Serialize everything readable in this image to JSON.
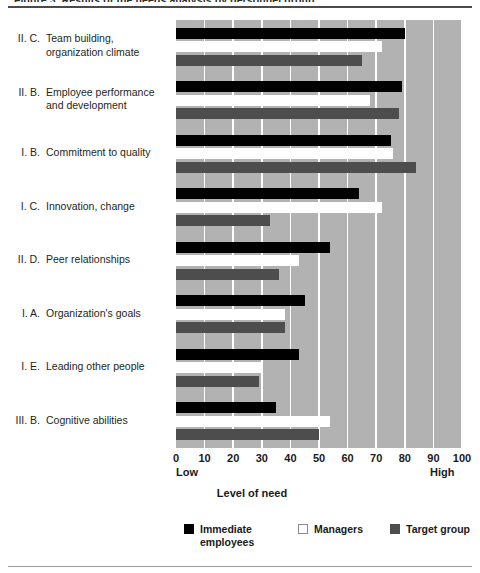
{
  "figure": {
    "caption_remnant": "Figure 3.  Results of the needs analysis by personnel group",
    "top_rule": "horizontal-rule",
    "bottom_rule": "horizontal-rule"
  },
  "chart_data": {
    "type": "bar",
    "orientation": "horizontal",
    "title": "",
    "xlabel": "Level of need",
    "ylabel": "",
    "xlim": [
      0,
      100
    ],
    "xticks": [
      0,
      10,
      20,
      30,
      40,
      50,
      60,
      70,
      80,
      90,
      100
    ],
    "xtick_labels": [
      "0",
      "10",
      "20",
      "30",
      "40",
      "50",
      "60",
      "70",
      "80",
      "90",
      "100"
    ],
    "axis_end_labels": {
      "low": "Low",
      "high": "High"
    },
    "grid": true,
    "grid_color": "#ffffff",
    "plot_background": "#b2b2b2",
    "legend_position": "bottom",
    "categories": [
      "II. C.  Team building, organization climate",
      "II. B.  Employee performance and development",
      "I. B.  Commitment to quality",
      "I. C.  Innovation, change",
      "II. D.  Peer relationships",
      "I. A.  Organization's goals",
      "I. E.  Leading other people",
      "III. B.  Cognitive abilities"
    ],
    "category_parts": [
      {
        "num": "II. C.",
        "text": "Team building,\norganization climate"
      },
      {
        "num": "II. B.",
        "text": "Employee performance\nand development"
      },
      {
        "num": "I. B.",
        "text": "Commitment to quality"
      },
      {
        "num": "I. C.",
        "text": "Innovation, change"
      },
      {
        "num": "II. D.",
        "text": "Peer relationships"
      },
      {
        "num": "I. A.",
        "text": "Organization's goals"
      },
      {
        "num": "I. E.",
        "text": "Leading other people"
      },
      {
        "num": "III. B.",
        "text": "Cognitive abilities"
      }
    ],
    "series": [
      {
        "name": "Immediate employees",
        "color": "#000000",
        "values": [
          80,
          79,
          75,
          64,
          54,
          45,
          43,
          35
        ]
      },
      {
        "name": "Managers",
        "color": "#ffffff",
        "values": [
          72,
          68,
          76,
          72,
          43,
          38,
          30,
          54
        ]
      },
      {
        "name": "Target group",
        "color": "#4d4d4d",
        "values": [
          65,
          78,
          84,
          33,
          36,
          38,
          29,
          50
        ]
      }
    ],
    "legend_entries": [
      {
        "label": "Immediate\nemployees",
        "color": "#000000",
        "swatch": "filled-black"
      },
      {
        "label": "Managers",
        "color": "#ffffff",
        "swatch": "outline-white"
      },
      {
        "label": "Target group",
        "color": "#4d4d4d",
        "swatch": "filled-gray"
      }
    ]
  }
}
